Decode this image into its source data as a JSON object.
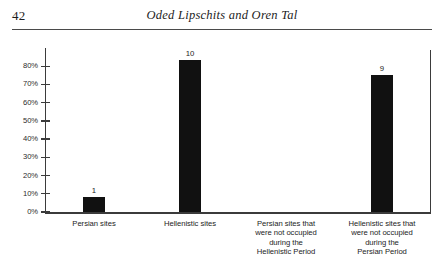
{
  "page": {
    "folio": "42",
    "running_head": "Oded Lipschits and Oren Tal"
  },
  "chart_data": {
    "type": "bar",
    "title": "",
    "xlabel": "",
    "ylabel": "",
    "ylim": [
      0,
      90
    ],
    "grid": false,
    "legend": "none",
    "bar_color": "#111111",
    "axis_color": "#3b3b3b",
    "categories": [
      "Persian sites",
      "Hellenistic sites",
      "Persian sites that were not occupied during the Hellenistic Period",
      "Hellenistic sites that were not occupied during the Persian Period"
    ],
    "category_lines": [
      [
        "Persian sites"
      ],
      [
        "Hellenistic sites"
      ],
      [
        "Persian sites that",
        "were not occupied",
        "during the",
        "Hellenistic Period"
      ],
      [
        "Hellenistic sites that",
        "were not occupied",
        "during the",
        "Persian Period"
      ]
    ],
    "data_labels": [
      "1",
      "10",
      "",
      "9"
    ],
    "values": [
      1,
      10,
      0,
      9
    ],
    "percent_values": [
      8.3,
      83.3,
      0,
      75.0
    ],
    "ytick_labels": [
      "0%",
      "10%",
      "20%",
      "30%",
      "40%",
      "50%",
      "60%",
      "70%",
      "80%"
    ],
    "ytick_values": [
      0,
      10,
      20,
      30,
      40,
      50,
      60,
      70,
      80
    ]
  }
}
